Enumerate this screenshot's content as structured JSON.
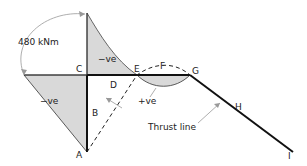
{
  "diagram": {
    "moment_label": "480 kNm",
    "points": {
      "A": "A",
      "B": "B",
      "C": "C",
      "D": "D",
      "E": "E",
      "F": "F",
      "G": "G",
      "H": "H",
      "I": "I"
    },
    "regions": {
      "upper_neg": "−ve",
      "left_neg": "−ve",
      "pos": "+ve"
    },
    "thrust_line_label": "Thrust line",
    "colors": {
      "member": "#111111",
      "shade": "#d9d9d9",
      "annotation": "#999999"
    }
  }
}
